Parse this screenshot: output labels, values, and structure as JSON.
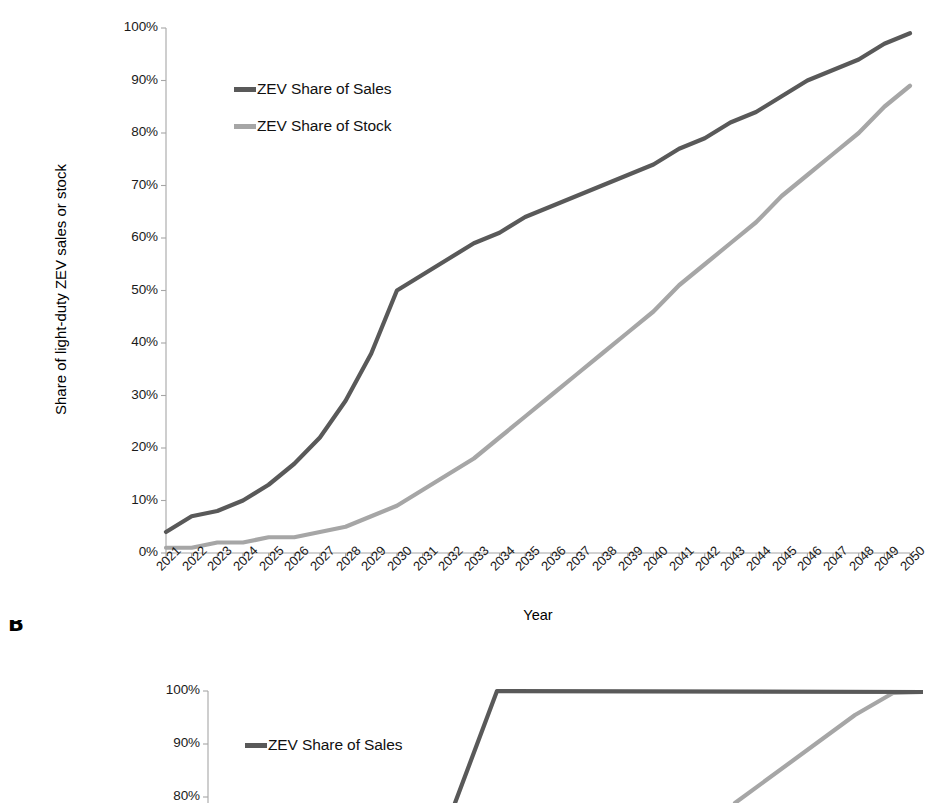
{
  "figure": {
    "panel_b_letter": "B",
    "colors": {
      "sales_line": "#595959",
      "stock_line": "#a6a6a6",
      "axis": "#a6a6a6",
      "text": "#1a1a1a"
    }
  },
  "panel_a": {
    "axis_title_y": "Share of light-duty ZEV sales or stock",
    "axis_title_x": "Year",
    "ytick_labels": [
      "100%",
      "90%",
      "80%",
      "70%",
      "60%",
      "50%",
      "40%",
      "30%",
      "20%",
      "10%",
      "0%"
    ],
    "legend": [
      {
        "label": "ZEV Share of Sales",
        "color": "#595959"
      },
      {
        "label": "ZEV Share of Stock",
        "color": "#a6a6a6"
      }
    ]
  },
  "panel_b": {
    "ytick_labels": [
      "100%",
      "90%",
      "80%"
    ],
    "legend": [
      {
        "label": "ZEV Share of Sales",
        "color": "#595959"
      }
    ]
  },
  "chart_data": [
    {
      "panel": "A",
      "type": "line",
      "title": "",
      "xlabel": "Year",
      "ylabel": "Share of light-duty ZEV sales or stock",
      "xlim": [
        2021,
        2050
      ],
      "ylim": [
        0,
        100
      ],
      "yunit": "%",
      "ytick_values": [
        0,
        10,
        20,
        30,
        40,
        50,
        60,
        70,
        80,
        90,
        100
      ],
      "grid": false,
      "legend_position": "upper-left-inside",
      "x": [
        2021,
        2022,
        2023,
        2024,
        2025,
        2026,
        2027,
        2028,
        2029,
        2030,
        2031,
        2032,
        2033,
        2034,
        2035,
        2036,
        2037,
        2038,
        2039,
        2040,
        2041,
        2042,
        2043,
        2044,
        2045,
        2046,
        2047,
        2048,
        2049,
        2050
      ],
      "series": [
        {
          "name": "ZEV Share of Sales",
          "color": "#595959",
          "values": [
            4,
            7,
            8,
            10,
            13,
            17,
            22,
            29,
            38,
            50,
            53,
            56,
            59,
            61,
            64,
            66,
            68,
            70,
            72,
            74,
            77,
            79,
            82,
            84,
            87,
            90,
            92,
            94,
            97,
            99
          ]
        },
        {
          "name": "ZEV Share of Stock",
          "color": "#a6a6a6",
          "values": [
            1,
            1,
            2,
            2,
            3,
            3,
            4,
            5,
            7,
            9,
            12,
            15,
            18,
            22,
            26,
            30,
            34,
            38,
            42,
            46,
            51,
            55,
            59,
            63,
            68,
            72,
            76,
            80,
            85,
            89
          ]
        }
      ]
    },
    {
      "panel": "B",
      "type": "line",
      "note": "cropped at bottom of screenshot",
      "xlabel": "Year",
      "ylim": [
        0,
        100
      ],
      "yunit": "%",
      "ytick_values": [
        80,
        90,
        100
      ],
      "visible_ytick_values": [
        100,
        90,
        80
      ],
      "grid": false,
      "legend_position": "upper-left-inside",
      "series": [
        {
          "name": "ZEV Share of Sales",
          "color": "#595959",
          "description": "rises steeply, reaches 100% plateau and remains flat to 2050"
        },
        {
          "name": "ZEV Share of Stock",
          "color": "#a6a6a6",
          "description": "rises steeply at right, converges to 100% near 2050"
        }
      ]
    }
  ]
}
